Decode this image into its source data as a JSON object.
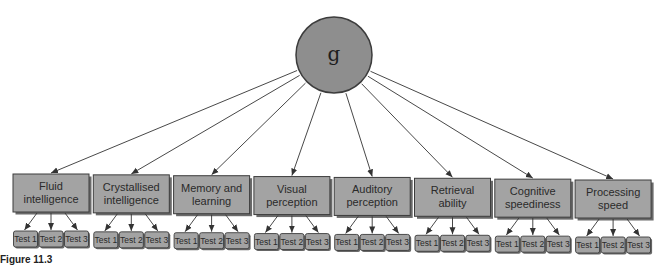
{
  "diagram": {
    "type": "hierarchical-factor-model",
    "root": {
      "label": "g"
    },
    "factors": [
      {
        "label_lines": [
          "Fluid",
          "intelligence"
        ],
        "tests": [
          "Test 1",
          "Test 2",
          "Test 3"
        ]
      },
      {
        "label_lines": [
          "Crystallised",
          "intelligence"
        ],
        "tests": [
          "Test 1",
          "Test 2",
          "Test 3"
        ]
      },
      {
        "label_lines": [
          "Memory and",
          "learning"
        ],
        "tests": [
          "Test 1",
          "Test 2",
          "Test 3"
        ]
      },
      {
        "label_lines": [
          "Visual",
          "perception"
        ],
        "tests": [
          "Test 1",
          "Test 2",
          "Test 3"
        ]
      },
      {
        "label_lines": [
          "Auditory",
          "perception"
        ],
        "tests": [
          "Test 1",
          "Test 2",
          "Test 3"
        ]
      },
      {
        "label_lines": [
          "Retrieval",
          "ability"
        ],
        "tests": [
          "Test 1",
          "Test 2",
          "Test 3"
        ]
      },
      {
        "label_lines": [
          "Cognitive",
          "speediness"
        ],
        "tests": [
          "Test 1",
          "Test 2",
          "Test 3"
        ]
      },
      {
        "label_lines": [
          "Processing",
          "speed"
        ],
        "tests": [
          "Test 1",
          "Test 2",
          "Test 3"
        ]
      }
    ],
    "caption": "Figure 11.3",
    "colors": {
      "root_fill": "#8e8e8e",
      "box_fill": "#a3a3a3",
      "border": "#3c3c3c",
      "shadow": "#6a6a6a",
      "arrow": "#333333"
    }
  }
}
